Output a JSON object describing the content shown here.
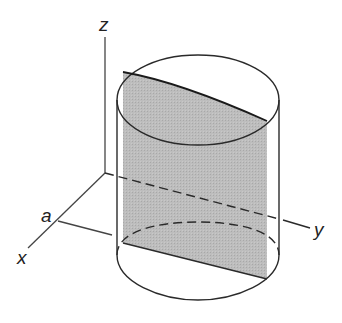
{
  "figure": {
    "axes": {
      "z_label": "z",
      "y_label": "y",
      "x_label": "x",
      "tick_label": "a"
    },
    "colors": {
      "line": "#2a2a2a",
      "plane_fill": "#b4b4b4",
      "background": "#ffffff"
    }
  }
}
